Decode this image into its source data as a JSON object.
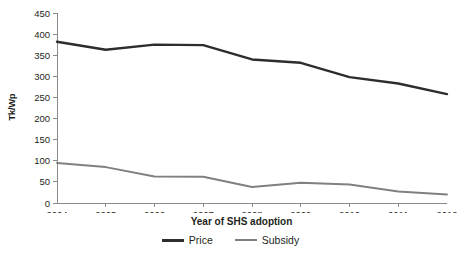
{
  "chart_data": {
    "type": "line",
    "title": "",
    "xlabel": "Year of SHS adoption",
    "ylabel": "Tk/Wp",
    "categories": [
      "2004",
      "2005",
      "2006",
      "2007",
      "2008",
      "2009",
      "2010",
      "2011",
      "2012"
    ],
    "x": [
      2004,
      2005,
      2006,
      2007,
      2008,
      2009,
      2010,
      2011,
      2012
    ],
    "series": [
      {
        "name": "Price",
        "color": "#2d2d2d",
        "values": [
          382,
          363,
          375,
          374,
          340,
          332,
          298,
          283,
          258
        ]
      },
      {
        "name": "Subsidy",
        "color": "#808080",
        "values": [
          95,
          85,
          63,
          62,
          38,
          48,
          44,
          27,
          20
        ]
      }
    ],
    "ylim": [
      0,
      450
    ],
    "yticks": [
      0,
      50,
      100,
      150,
      200,
      250,
      300,
      350,
      400,
      450
    ],
    "ytick_labels": [
      "0",
      "50",
      "100",
      "150",
      "200",
      "250",
      "300",
      "350",
      "400",
      "450"
    ],
    "xlim": [
      2004,
      2012
    ],
    "grid": false,
    "legend_position": "bottom-center"
  },
  "axes": {
    "y_title": "Tk/Wp",
    "x_title": "Year of SHS adoption"
  },
  "legend": {
    "items": [
      {
        "label": "Price",
        "color": "#2d2d2d"
      },
      {
        "label": "Subsidy",
        "color": "#808080"
      }
    ]
  },
  "colors": {
    "price": "#2d2d2d",
    "subsidy": "#808080",
    "axis": "#8a8a8a",
    "text": "#231f20",
    "background": "#ffffff"
  }
}
